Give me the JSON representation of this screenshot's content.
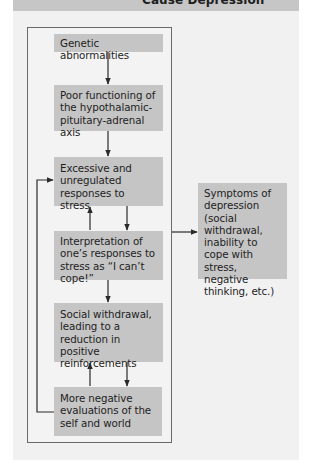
{
  "header": {
    "title": "Cause Depression"
  },
  "diagram": {
    "nodes": [
      {
        "id": "genetic",
        "label": "Genetic abnormalities"
      },
      {
        "id": "hpa",
        "label": "Poor functioning of the hypothalamic-pituitary-adrenal axis"
      },
      {
        "id": "excessive",
        "label": "Excessive and unregulated responses to stress"
      },
      {
        "id": "interpretation",
        "label": "Interpretation of one’s responses to stress as “I can’t cope!”"
      },
      {
        "id": "withdrawal",
        "label": "Social withdrawal, leading to a reduction in positive reinforcements"
      },
      {
        "id": "negative",
        "label": "More negative evaluations of the self and world"
      },
      {
        "id": "symptoms",
        "label": "Symptoms of depression (social withdrawal, inability to cope with stress, negative thinking, etc.)"
      }
    ],
    "edges": [
      {
        "from": "genetic",
        "to": "hpa"
      },
      {
        "from": "hpa",
        "to": "excessive"
      },
      {
        "from": "excessive",
        "to": "interpretation"
      },
      {
        "from": "interpretation",
        "to": "excessive"
      },
      {
        "from": "interpretation",
        "to": "withdrawal"
      },
      {
        "from": "withdrawal",
        "to": "negative"
      },
      {
        "from": "negative",
        "to": "withdrawal"
      },
      {
        "from": "negative",
        "to": "excessive"
      },
      {
        "from": "frame",
        "to": "symptoms"
      }
    ],
    "colors": {
      "box_fill": "#c5c5c5",
      "panel_fill": "#f1f1f1",
      "header_fill": "#c6c6c6",
      "line": "#2a2a2a"
    }
  }
}
